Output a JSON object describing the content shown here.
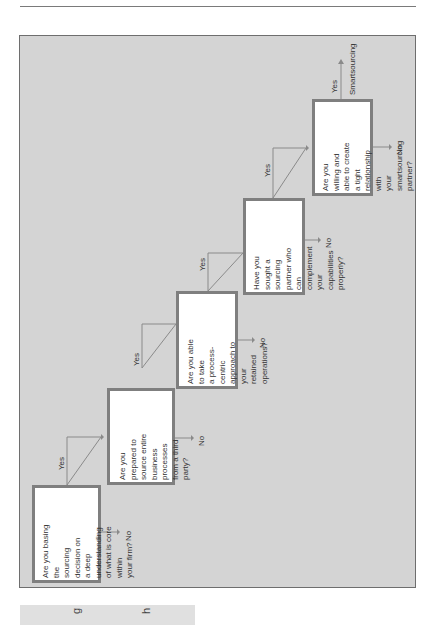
{
  "diagram": {
    "type": "flowchart",
    "orientation": "rotated-90-ccw",
    "questions": [
      {
        "id": "q1",
        "text": "Are you basing the\nsourcing decision on\na deep understanding\nof what is core within\nyour firm?",
        "yes_label": "Yes",
        "no_label": "No"
      },
      {
        "id": "q2",
        "text": "Are you prepared to\nsource entire\nbusiness processes\nfrom a third party?",
        "yes_label": "Yes",
        "no_label": "No"
      },
      {
        "id": "q3",
        "text": "Are you able to take\na process-centric\napproach to your\nretained operations?",
        "yes_label": "Yes",
        "no_label": "No"
      },
      {
        "id": "q4",
        "text": "Have you sought a\nsourcing partner who\ncan complement\nyour capabilities\nproperly?",
        "yes_label": "Yes",
        "no_label": "No"
      },
      {
        "id": "q5",
        "text": "Are you willing and\nable to create a tight\nrelationship with\nyour smartsourcing\npartner?",
        "yes_label": "Yes",
        "no_label": "No"
      }
    ],
    "outcome": "Smartsourcing",
    "colors": {
      "panel": "#d4d4d4",
      "box_border": "#7f7f7f",
      "line": "#8a8a8a"
    }
  },
  "bottom_strip": {
    "letters": [
      "g",
      "h"
    ]
  }
}
